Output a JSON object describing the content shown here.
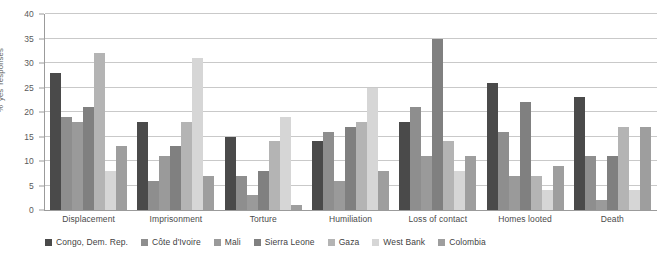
{
  "chart_data": {
    "type": "bar",
    "title": "",
    "subtitle": "",
    "xlabel": "",
    "ylabel": "% 'yes' responses",
    "ylim": [
      0,
      40
    ],
    "ytick_step": 5,
    "yticks": [
      0,
      5,
      10,
      15,
      20,
      25,
      30,
      35,
      40
    ],
    "grid": true,
    "grid_axis": "y",
    "legend_position": "bottom",
    "orientation": "vertical",
    "categories": [
      "Displacement",
      "Imprisonment",
      "Torture",
      "Humiliation",
      "Loss of contact",
      "Homes looted",
      "Death"
    ],
    "series": [
      {
        "name": "Congo, Dem. Rep.",
        "color": "#4a4a4a",
        "values": [
          28,
          18,
          15,
          14,
          18,
          26,
          23
        ]
      },
      {
        "name": "Côte d'Ivoire",
        "color": "#8e8e8e",
        "values": [
          19,
          6,
          7,
          16,
          21,
          16,
          11
        ]
      },
      {
        "name": "Mali",
        "color": "#9a9a9a",
        "values": [
          18,
          11,
          3,
          6,
          11,
          7,
          2
        ]
      },
      {
        "name": "Sierra Leone",
        "color": "#808080",
        "values": [
          21,
          13,
          8,
          17,
          35,
          22,
          11
        ]
      },
      {
        "name": "Gaza",
        "color": "#b4b4b4",
        "values": [
          32,
          18,
          14,
          18,
          14,
          7,
          17
        ]
      },
      {
        "name": "West Bank",
        "color": "#d6d6d6",
        "values": [
          8,
          31,
          19,
          25,
          8,
          4,
          4
        ]
      },
      {
        "name": "Colombia",
        "color": "#9e9e9e",
        "values": [
          13,
          7,
          1,
          8,
          11,
          9,
          17
        ]
      }
    ]
  },
  "colors": {
    "axis": "#9b9b9b",
    "gridline": "#c9c9c9",
    "text": "#4a4a4a",
    "background": "#ffffff"
  }
}
